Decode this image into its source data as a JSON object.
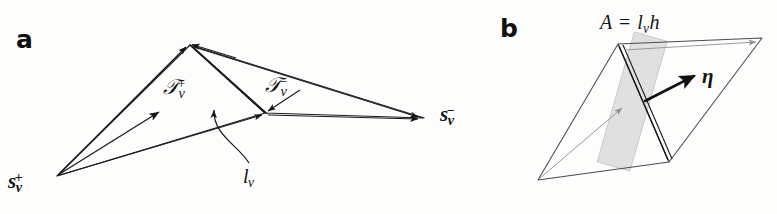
{
  "figure": {
    "background_color": "#fdfdfc",
    "ink_color": "#141414",
    "faint_ink_color": "#8c8c8c",
    "band_color": "#d6d6d6",
    "width": 777,
    "height": 214
  },
  "panels": {
    "a": {
      "label": "a",
      "labels": {
        "triangle_plus": "𝒯",
        "triangle_plus_sub": "ν",
        "triangle_plus_sup": "+",
        "triangle_minus": "𝒯",
        "triangle_minus_sub": "ν",
        "triangle_minus_sup": "−",
        "source_plus": "s",
        "source_plus_sub": "ν",
        "source_plus_sup": "+",
        "source_minus": "s",
        "source_minus_sub": "ν",
        "source_minus_sup": "−",
        "edge_length": "l",
        "edge_length_sub": "ν"
      }
    },
    "b": {
      "label": "b",
      "labels": {
        "area_expression": "A = l",
        "area_sub": "ν",
        "area_tail": "h",
        "normal": "η"
      }
    }
  },
  "geometry": {
    "panel_a": {
      "s_plus": [
        57,
        176
      ],
      "apex_top": [
        190,
        45
      ],
      "vertex_mid": [
        265,
        113
      ],
      "s_minus": [
        424,
        118
      ],
      "arrow_to_Tplus_tip": [
        158,
        113
      ],
      "arrow_to_apex_tip": [
        186,
        47
      ],
      "arrow_to_mid_tip": [
        262,
        115
      ],
      "arrow_to_sminus_tip": [
        420,
        119
      ],
      "leader_curve_label": [
        250,
        170
      ]
    },
    "panel_b": {
      "left_vertex": [
        538,
        180
      ],
      "top_vertex": [
        618,
        44
      ],
      "bottom_vertex": [
        669,
        162
      ],
      "right_vertex": [
        762,
        38
      ],
      "band_angle_deg": 16,
      "eta_origin": [
        645,
        100
      ],
      "eta_tip": [
        694,
        76
      ]
    }
  }
}
